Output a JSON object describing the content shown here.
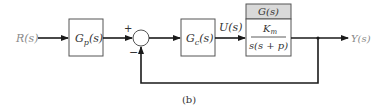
{
  "diagram": {
    "caption": "(b)",
    "input_label": "R(s)",
    "output_label": "Y(s)",
    "prefilter": {
      "label": "G",
      "sub": "p",
      "arg": "(s)"
    },
    "controller": {
      "label": "G",
      "sub": "c",
      "arg": "(s)"
    },
    "control_signal_label": "U(s)",
    "plant": {
      "header": "G(s)",
      "numerator": "K",
      "numerator_sub": "m",
      "denominator": "s(s + p)"
    },
    "summing_junction": {
      "plus_sign": "+",
      "minus_sign": "−"
    },
    "colors": {
      "line": "#1a1a1a",
      "block_border": "#555555",
      "plant_header_fill": "#d9d9d9",
      "signal_label": "#8a8a8a"
    }
  }
}
